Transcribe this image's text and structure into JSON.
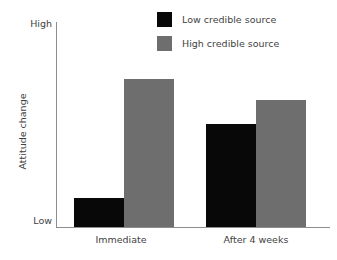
{
  "chart_data": {
    "type": "bar",
    "title": "",
    "subtitle": "",
    "xlabel": "",
    "ylabel": "Attitude change",
    "categories": [
      "Immediate",
      "After 4 weeks"
    ],
    "series": [
      {
        "name": "Low credible source",
        "color": "#080808",
        "values": [
          14,
          50
        ]
      },
      {
        "name": "High credible source",
        "color": "#6e6e6e",
        "values": [
          72,
          62
        ]
      }
    ],
    "ylim": [
      0,
      100
    ],
    "ytick_labels": [
      "Low",
      "High"
    ],
    "ytick_values": [
      0,
      100
    ],
    "grid": false,
    "legend_position": "top-right",
    "annotations": []
  },
  "axes": {
    "y_high_label": "High",
    "y_low_label": "Low",
    "y_axis_title": "Attitude change"
  },
  "legend": {
    "entries": [
      {
        "label": "Low credible source",
        "swatch": "low"
      },
      {
        "label": "High credible source",
        "swatch": "high"
      }
    ]
  },
  "categories": [
    {
      "label": "Immediate"
    },
    {
      "label": "After 4 weeks"
    }
  ],
  "colors": {
    "low_credible": "#080808",
    "high_credible": "#6e6e6e",
    "axis": "#8d8d8d",
    "text": "#3f3f3f",
    "background": "#ffffff"
  }
}
